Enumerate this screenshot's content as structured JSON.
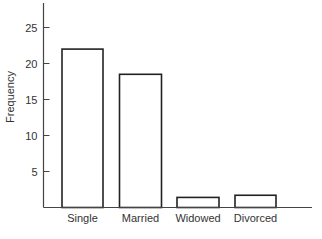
{
  "chart_data": {
    "type": "bar",
    "title": "",
    "xlabel": "",
    "ylabel": "Frequency",
    "categories": [
      "Single",
      "Married",
      "Widowed",
      "Divorced"
    ],
    "values": [
      22,
      18.5,
      1.4,
      1.7
    ],
    "ylim": [
      0,
      28
    ],
    "yticks": [
      5,
      10,
      15,
      20,
      25
    ],
    "grid": false,
    "legend": null,
    "colors": {
      "bar_fill": "#ffffff",
      "bar_stroke": "#222222",
      "axis": "#444444"
    }
  }
}
